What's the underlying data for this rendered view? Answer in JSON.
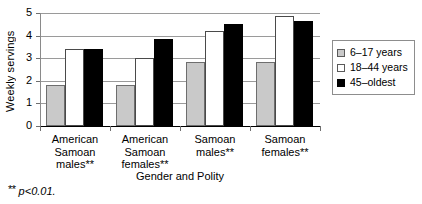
{
  "chart_data": {
    "type": "bar",
    "title": "",
    "xlabel": "Gender and Polity",
    "ylabel": "Weekly servings",
    "categories": [
      "American\nSamoan\nmales**",
      "American\nSamoan\nfemales**",
      "Samoan\nmales**",
      "Samoan\nfemales**"
    ],
    "series": [
      {
        "name": "6–17 years",
        "values": [
          1.8,
          1.8,
          2.82,
          2.82
        ]
      },
      {
        "name": "18–44 years",
        "values": [
          3.4,
          3.0,
          4.22,
          4.85
        ]
      },
      {
        "name": "45–oldest",
        "values": [
          3.4,
          3.83,
          4.5,
          4.65
        ]
      }
    ],
    "ylim": [
      0,
      5
    ],
    "yticks": [
      0,
      1,
      2,
      3,
      4,
      5
    ],
    "ytick_labels": [
      "0",
      "1",
      "2",
      "3",
      "4",
      "5"
    ],
    "grid": true,
    "legend_position": "right",
    "colors": {
      "series_0": "#c9c9c9",
      "series_1": "#ffffff",
      "series_2": "#000000",
      "grid": "#9a9a9a",
      "axis": "#000000"
    }
  },
  "footnote": {
    "stars": "**",
    "text": " p<0.01."
  }
}
